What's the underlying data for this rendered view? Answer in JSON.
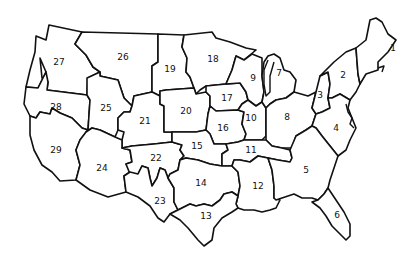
{
  "map": {
    "title": "",
    "description": "Outline map of the contiguous United States divided into 29 numbered regions",
    "colors": {
      "stroke": "#111111",
      "fill": "#ffffff",
      "background": "#ffffff"
    },
    "regions": [
      {
        "id": 1,
        "label": "1",
        "x": 393,
        "y": 48
      },
      {
        "id": 2,
        "label": "2",
        "x": 343,
        "y": 75
      },
      {
        "id": 3,
        "label": "3",
        "x": 320,
        "y": 95
      },
      {
        "id": 4,
        "label": "4",
        "x": 336,
        "y": 128
      },
      {
        "id": 5,
        "label": "5",
        "x": 306,
        "y": 170
      },
      {
        "id": 6,
        "label": "6",
        "x": 337,
        "y": 215
      },
      {
        "id": 7,
        "label": "7",
        "x": 279,
        "y": 73
      },
      {
        "id": 8,
        "label": "8",
        "x": 287,
        "y": 117
      },
      {
        "id": 9,
        "label": "9",
        "x": 253,
        "y": 78
      },
      {
        "id": 10,
        "label": "10",
        "x": 251,
        "y": 118
      },
      {
        "id": 11,
        "label": "11",
        "x": 251,
        "y": 150
      },
      {
        "id": 12,
        "label": "12",
        "x": 258,
        "y": 186
      },
      {
        "id": 13,
        "label": "13",
        "x": 206,
        "y": 216
      },
      {
        "id": 14,
        "label": "14",
        "x": 201,
        "y": 183
      },
      {
        "id": 15,
        "label": "15",
        "x": 197,
        "y": 146
      },
      {
        "id": 16,
        "label": "16",
        "x": 223,
        "y": 128
      },
      {
        "id": 17,
        "label": "17",
        "x": 227,
        "y": 98
      },
      {
        "id": 18,
        "label": "18",
        "x": 213,
        "y": 59
      },
      {
        "id": 19,
        "label": "19",
        "x": 170,
        "y": 69
      },
      {
        "id": 20,
        "label": "20",
        "x": 186,
        "y": 111
      },
      {
        "id": 21,
        "label": "21",
        "x": 145,
        "y": 121
      },
      {
        "id": 22,
        "label": "22",
        "x": 156,
        "y": 158
      },
      {
        "id": 23,
        "label": "23",
        "x": 160,
        "y": 201
      },
      {
        "id": 24,
        "label": "24",
        "x": 102,
        "y": 168
      },
      {
        "id": 25,
        "label": "25",
        "x": 106,
        "y": 108
      },
      {
        "id": 26,
        "label": "26",
        "x": 123,
        "y": 57
      },
      {
        "id": 27,
        "label": "27",
        "x": 59,
        "y": 62
      },
      {
        "id": 28,
        "label": "28",
        "x": 56,
        "y": 107
      },
      {
        "id": 29,
        "label": "29",
        "x": 56,
        "y": 150
      }
    ]
  }
}
